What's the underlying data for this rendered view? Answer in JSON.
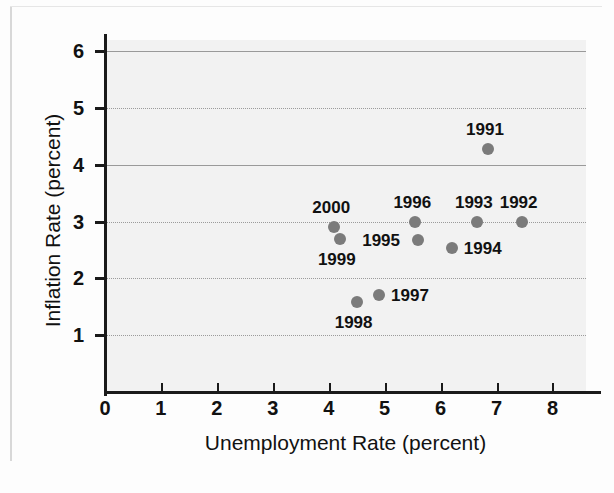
{
  "chart_data": {
    "type": "scatter",
    "title": "",
    "xlabel": "Unemployment Rate (percent)",
    "ylabel": "Inflation Rate (percent)",
    "xlim": [
      0,
      8.6
    ],
    "ylim": [
      0,
      6.2
    ],
    "xticks": [
      "0",
      "1",
      "2",
      "3",
      "4",
      "5",
      "6",
      "7",
      "8"
    ],
    "yticks": [
      "1",
      "2",
      "3",
      "4",
      "5",
      "6"
    ],
    "grid": "horizontal",
    "legend": "none",
    "marker_color": "#7b7b7b",
    "plot_background": "#f2f2f2",
    "points": [
      {
        "label": "1991",
        "x": 6.85,
        "y": 4.28,
        "label_pos": "above"
      },
      {
        "label": "1992",
        "x": 7.45,
        "y": 3.0,
        "label_pos": "above"
      },
      {
        "label": "1993",
        "x": 6.65,
        "y": 3.0,
        "label_pos": "above"
      },
      {
        "label": "1994",
        "x": 6.2,
        "y": 2.53,
        "label_pos": "right"
      },
      {
        "label": "1995",
        "x": 5.6,
        "y": 2.68,
        "label_pos": "left"
      },
      {
        "label": "1996",
        "x": 5.55,
        "y": 3.0,
        "label_pos": "above"
      },
      {
        "label": "1997",
        "x": 4.9,
        "y": 1.7,
        "label_pos": "right"
      },
      {
        "label": "1998",
        "x": 4.5,
        "y": 1.58,
        "label_pos": "below"
      },
      {
        "label": "1999",
        "x": 4.2,
        "y": 2.7,
        "label_pos": "below"
      },
      {
        "label": "2000",
        "x": 4.1,
        "y": 2.9,
        "label_pos": "above"
      }
    ]
  }
}
